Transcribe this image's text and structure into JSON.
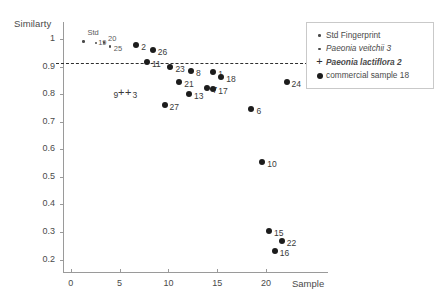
{
  "axes": {
    "y_title": "Similarty",
    "x_title": "Sample",
    "y_ticks": [
      "1",
      "0.9",
      "0.8",
      "0.7",
      "0.6",
      "0.5",
      "0.4",
      "0.3",
      "0.2"
    ],
    "x_ticks": [
      "0",
      "5",
      "10",
      "15",
      "20"
    ]
  },
  "legend": {
    "items": [
      {
        "marker": "small-dot-icon",
        "label": "Std Fingerprint",
        "style": "plain"
      },
      {
        "marker": "small-dot-icon",
        "label": "Paeonia veitchii  3",
        "style": "italic"
      },
      {
        "marker": "plus-icon",
        "label": "Paeonia lactiflora  2",
        "style": "bold-italic"
      },
      {
        "marker": "large-dot-icon",
        "label": "commercial sample  18",
        "style": "plain"
      }
    ]
  },
  "caption": "",
  "chart_data": {
    "type": "scatter",
    "title": "",
    "xlabel": "Sample",
    "ylabel": "Similarty",
    "xlim": [
      -0.8,
      24.5
    ],
    "ylim": [
      0.155,
      1.04
    ],
    "grid": false,
    "legend_position": "right",
    "annotations": [
      {
        "type": "hline",
        "y": 0.912,
        "style": "dashed",
        "label": ""
      }
    ],
    "series": [
      {
        "name": "Std Fingerprint",
        "marker": "small-dot",
        "points": [
          {
            "label": "Std",
            "x": 1.3,
            "y": 0.992
          },
          {
            "label": "19",
            "x": 2.6,
            "y": 0.985
          },
          {
            "label": "20",
            "x": 3.4,
            "y": 0.987
          },
          {
            "label": "25",
            "x": 4.0,
            "y": 0.972
          }
        ]
      },
      {
        "name": "Paeonia veitchii  3",
        "marker": "small-dot",
        "points": []
      },
      {
        "name": "Paeonia lactiflora  2",
        "marker": "plus",
        "points": [
          {
            "label": "9",
            "x": 5.2,
            "y": 0.805
          },
          {
            "label": "3",
            "x": 5.9,
            "y": 0.805
          }
        ]
      },
      {
        "name": "commercial sample  18",
        "marker": "large-dot",
        "points": [
          {
            "label": "2",
            "x": 6.7,
            "y": 0.978
          },
          {
            "label": "26",
            "x": 8.4,
            "y": 0.962
          },
          {
            "label": "11",
            "x": 7.8,
            "y": 0.918
          },
          {
            "label": "23",
            "x": 10.2,
            "y": 0.897
          },
          {
            "label": "8",
            "x": 12.3,
            "y": 0.885
          },
          {
            "label": "1",
            "x": 14.6,
            "y": 0.88
          },
          {
            "label": "18",
            "x": 15.4,
            "y": 0.862
          },
          {
            "label": "21",
            "x": 11.1,
            "y": 0.843
          },
          {
            "label": "7",
            "x": 14.0,
            "y": 0.822
          },
          {
            "label": "17",
            "x": 14.6,
            "y": 0.82
          },
          {
            "label": "13",
            "x": 12.1,
            "y": 0.802
          },
          {
            "label": "27",
            "x": 9.6,
            "y": 0.762
          },
          {
            "label": "6",
            "x": 18.5,
            "y": 0.745
          },
          {
            "label": "24",
            "x": 22.1,
            "y": 0.845
          },
          {
            "label": "10",
            "x": 19.6,
            "y": 0.555
          },
          {
            "label": "15",
            "x": 20.3,
            "y": 0.302
          },
          {
            "label": "22",
            "x": 21.6,
            "y": 0.268
          },
          {
            "label": "16",
            "x": 20.9,
            "y": 0.232
          }
        ]
      }
    ]
  }
}
